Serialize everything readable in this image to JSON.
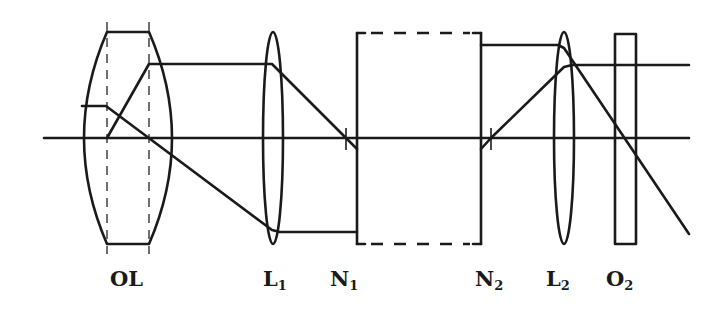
{
  "figure": {
    "type": "optical-system-schematic",
    "optical_axis_y": 138,
    "stroke_color": "#1a1a1a",
    "background": "#ffffff"
  },
  "labels": [
    {
      "id": "OL",
      "main": "OL",
      "sub": "",
      "x": 110
    },
    {
      "id": "L1",
      "main": "L",
      "sub": "1",
      "x": 263
    },
    {
      "id": "N1",
      "main": "N",
      "sub": "1",
      "x": 330
    },
    {
      "id": "N2",
      "main": "N",
      "sub": "2",
      "x": 475
    },
    {
      "id": "L2",
      "main": "L",
      "sub": "2",
      "x": 546
    },
    {
      "id": "O2",
      "main": "O",
      "sub": "2",
      "x": 606
    }
  ]
}
